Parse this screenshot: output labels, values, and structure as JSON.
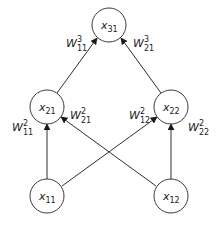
{
  "diagram": {
    "type": "neural-network",
    "colors": {
      "stroke": "#2e2e2e",
      "text": "#222222",
      "background": "#ffffff"
    },
    "nodes": [
      {
        "id": "x31",
        "var": "x",
        "sub": "31",
        "cx": 109,
        "cy": 25
      },
      {
        "id": "x21",
        "var": "x",
        "sub": "21",
        "cx": 47,
        "cy": 107
      },
      {
        "id": "x22",
        "var": "x",
        "sub": "22",
        "cx": 171,
        "cy": 107
      },
      {
        "id": "x11",
        "var": "x",
        "sub": "11",
        "cx": 47,
        "cy": 196
      },
      {
        "id": "x12",
        "var": "x",
        "sub": "12",
        "cx": 171,
        "cy": 196
      }
    ],
    "edges": [
      {
        "from": "x21",
        "to": "x31",
        "weight": {
          "var": "W",
          "sup": "3",
          "sub": "11"
        }
      },
      {
        "from": "x22",
        "to": "x31",
        "weight": {
          "var": "W",
          "sup": "3",
          "sub": "21"
        }
      },
      {
        "from": "x11",
        "to": "x21",
        "weight": {
          "var": "W",
          "sup": "2",
          "sub": "11"
        }
      },
      {
        "from": "x12",
        "to": "x21",
        "weight": {
          "var": "W",
          "sup": "2",
          "sub": "21"
        }
      },
      {
        "from": "x11",
        "to": "x22",
        "weight": {
          "var": "W",
          "sup": "2",
          "sub": "12"
        }
      },
      {
        "from": "x12",
        "to": "x22",
        "weight": {
          "var": "W",
          "sup": "2",
          "sub": "22"
        }
      }
    ]
  }
}
